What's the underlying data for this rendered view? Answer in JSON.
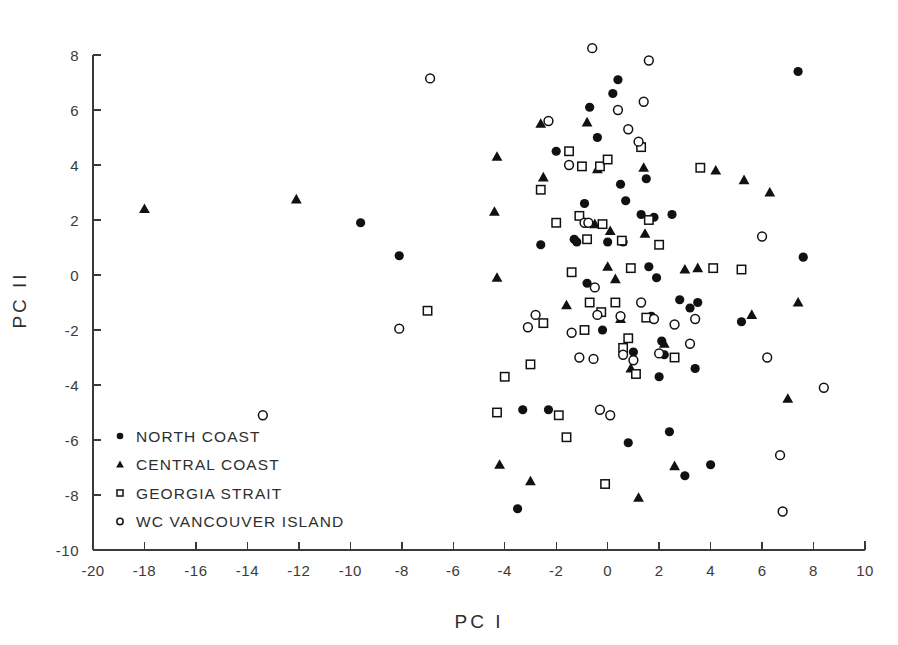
{
  "chart_data": {
    "type": "scatter",
    "title": "",
    "xlabel": "PC I",
    "ylabel": "PC II",
    "xlim": [
      -20,
      10
    ],
    "ylim": [
      -10,
      8
    ],
    "xticks": [
      -20,
      -18,
      -16,
      -14,
      -12,
      -10,
      -8,
      -6,
      -4,
      -2,
      0,
      2,
      4,
      6,
      8,
      10
    ],
    "xtick_labels": [
      "-20",
      "-18",
      "-16",
      "-14",
      "-12",
      "-10",
      "-8",
      "-6",
      "-4",
      "-2",
      "0",
      "2",
      "4",
      "6",
      "8",
      "10"
    ],
    "yticks": [
      -10,
      -8,
      -6,
      -4,
      -2,
      0,
      2,
      4,
      6,
      8
    ],
    "ytick_labels": [
      "-10",
      "-8",
      "-6",
      "-4",
      "-2",
      "0",
      "2",
      "4",
      "6",
      "8"
    ],
    "grid": false,
    "legend_position": "lower-left-inside",
    "marker_color": "#111111",
    "series": [
      {
        "name": "NORTH COAST",
        "marker": "filled-circle",
        "points": [
          [
            -9.6,
            1.9
          ],
          [
            -8.1,
            0.7
          ],
          [
            -3.5,
            -8.5
          ],
          [
            -3.3,
            -4.9
          ],
          [
            -2.3,
            -4.9
          ],
          [
            -2.6,
            1.1
          ],
          [
            -2.0,
            4.5
          ],
          [
            -1.3,
            1.3
          ],
          [
            -1.2,
            1.2
          ],
          [
            -0.9,
            2.6
          ],
          [
            -0.8,
            -0.3
          ],
          [
            -0.7,
            6.1
          ],
          [
            -0.4,
            5.0
          ],
          [
            -0.2,
            -2.0
          ],
          [
            0.0,
            1.2
          ],
          [
            0.2,
            6.6
          ],
          [
            0.4,
            7.1
          ],
          [
            0.5,
            3.3
          ],
          [
            0.6,
            1.2
          ],
          [
            0.7,
            2.7
          ],
          [
            0.8,
            -6.1
          ],
          [
            1.0,
            -2.8
          ],
          [
            1.3,
            2.2
          ],
          [
            1.5,
            3.5
          ],
          [
            1.6,
            0.3
          ],
          [
            1.7,
            -1.5
          ],
          [
            1.8,
            2.1
          ],
          [
            1.9,
            -0.1
          ],
          [
            2.0,
            -3.7
          ],
          [
            2.1,
            -2.4
          ],
          [
            2.2,
            -2.9
          ],
          [
            2.4,
            -5.7
          ],
          [
            2.5,
            2.2
          ],
          [
            2.8,
            -0.9
          ],
          [
            3.0,
            -7.3
          ],
          [
            3.2,
            -1.2
          ],
          [
            3.4,
            -3.4
          ],
          [
            3.5,
            -1.0
          ],
          [
            4.0,
            -6.9
          ],
          [
            5.2,
            -1.7
          ],
          [
            7.4,
            7.4
          ],
          [
            7.6,
            0.65
          ]
        ]
      },
      {
        "name": "CENTRAL COAST",
        "marker": "filled-triangle",
        "points": [
          [
            -18.0,
            2.4
          ],
          [
            -12.1,
            2.75
          ],
          [
            -4.3,
            4.3
          ],
          [
            -4.4,
            2.3
          ],
          [
            -4.3,
            -0.1
          ],
          [
            -4.2,
            -6.9
          ],
          [
            -3.0,
            -7.5
          ],
          [
            -2.6,
            5.5
          ],
          [
            -2.5,
            3.55
          ],
          [
            -1.6,
            -1.1
          ],
          [
            -0.8,
            5.55
          ],
          [
            -0.5,
            1.85
          ],
          [
            -0.4,
            3.85
          ],
          [
            0.0,
            0.3
          ],
          [
            0.1,
            1.6
          ],
          [
            0.3,
            -0.15
          ],
          [
            0.5,
            -1.6
          ],
          [
            0.9,
            -3.4
          ],
          [
            1.2,
            -8.1
          ],
          [
            1.4,
            3.9
          ],
          [
            1.45,
            1.5
          ],
          [
            2.2,
            -2.5
          ],
          [
            2.6,
            -6.95
          ],
          [
            3.0,
            0.2
          ],
          [
            3.5,
            0.25
          ],
          [
            4.2,
            3.8
          ],
          [
            5.3,
            3.45
          ],
          [
            5.6,
            -1.45
          ],
          [
            6.3,
            3.0
          ],
          [
            7.4,
            -1.0
          ],
          [
            7.0,
            -4.5
          ]
        ]
      },
      {
        "name": "GEORGIA STRAIT",
        "marker": "open-square",
        "points": [
          [
            -7.0,
            -1.3
          ],
          [
            -4.3,
            -5.0
          ],
          [
            -4.0,
            -3.7
          ],
          [
            -3.0,
            -3.25
          ],
          [
            -2.6,
            3.1
          ],
          [
            -2.5,
            -1.75
          ],
          [
            -2.0,
            1.9
          ],
          [
            -1.9,
            -5.1
          ],
          [
            -1.6,
            -5.9
          ],
          [
            -1.5,
            4.5
          ],
          [
            -1.4,
            0.1
          ],
          [
            -1.1,
            2.15
          ],
          [
            -1.0,
            3.95
          ],
          [
            -0.9,
            -2.0
          ],
          [
            -0.8,
            1.3
          ],
          [
            -0.7,
            -1.0
          ],
          [
            -0.3,
            3.95
          ],
          [
            -0.25,
            -1.35
          ],
          [
            -0.2,
            1.85
          ],
          [
            -0.1,
            -7.6
          ],
          [
            0.0,
            4.2
          ],
          [
            0.3,
            -1.0
          ],
          [
            0.55,
            1.25
          ],
          [
            0.6,
            -2.65
          ],
          [
            0.8,
            -2.3
          ],
          [
            0.9,
            0.25
          ],
          [
            1.1,
            -3.6
          ],
          [
            1.3,
            4.65
          ],
          [
            1.5,
            -1.55
          ],
          [
            1.6,
            2.0
          ],
          [
            2.0,
            1.1
          ],
          [
            2.6,
            -3.0
          ],
          [
            3.6,
            3.9
          ],
          [
            4.1,
            0.25
          ],
          [
            5.2,
            0.2
          ]
        ]
      },
      {
        "name": "WC VANCOUVER ISLAND",
        "marker": "open-circle",
        "points": [
          [
            -13.4,
            -5.1
          ],
          [
            -8.1,
            -1.95
          ],
          [
            -6.9,
            7.15
          ],
          [
            -3.1,
            -1.9
          ],
          [
            -2.8,
            -1.45
          ],
          [
            -2.3,
            5.6
          ],
          [
            -1.5,
            4.0
          ],
          [
            -1.4,
            -2.1
          ],
          [
            -1.1,
            -3.0
          ],
          [
            -0.9,
            1.9
          ],
          [
            -0.75,
            1.9
          ],
          [
            -0.6,
            8.25
          ],
          [
            -0.55,
            -3.05
          ],
          [
            -0.5,
            -0.45
          ],
          [
            -0.4,
            -1.45
          ],
          [
            -0.3,
            -4.9
          ],
          [
            0.1,
            -5.1
          ],
          [
            0.4,
            6.0
          ],
          [
            0.5,
            -1.5
          ],
          [
            0.6,
            -2.9
          ],
          [
            0.8,
            5.3
          ],
          [
            1.0,
            -3.1
          ],
          [
            1.2,
            4.85
          ],
          [
            1.3,
            -1.0
          ],
          [
            1.4,
            6.3
          ],
          [
            1.6,
            7.8
          ],
          [
            1.8,
            -1.6
          ],
          [
            2.0,
            -2.85
          ],
          [
            2.6,
            -1.8
          ],
          [
            3.2,
            -2.5
          ],
          [
            3.4,
            -1.6
          ],
          [
            6.0,
            1.4
          ],
          [
            6.2,
            -3.0
          ],
          [
            6.7,
            -6.55
          ],
          [
            6.8,
            -8.6
          ],
          [
            8.4,
            -4.1
          ]
        ]
      }
    ]
  },
  "legend": {
    "entries": [
      {
        "label": "NORTH  COAST",
        "marker": "filled-circle"
      },
      {
        "label": "CENTRAL  COAST",
        "marker": "filled-triangle"
      },
      {
        "label": "GEORGIA  STRAIT",
        "marker": "open-square"
      },
      {
        "label": "WC  VANCOUVER  ISLAND",
        "marker": "open-circle"
      }
    ]
  }
}
